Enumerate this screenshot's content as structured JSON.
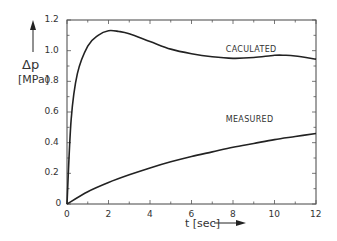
{
  "chart_data": {
    "type": "line",
    "title": "",
    "xlabel": "t [sec]",
    "ylabel_symbol": "Δp",
    "ylabel_unit": "[MPa]",
    "xlim": [
      0,
      12
    ],
    "ylim": [
      0,
      1.2
    ],
    "xticks": [
      "0",
      "2",
      "4",
      "6",
      "8",
      "10",
      "12"
    ],
    "yticks": [
      "0",
      "0.2",
      "0.4",
      "0.6",
      "0.8",
      "1.0",
      "1.2"
    ],
    "grid": false,
    "legend": "inline curve labels",
    "series": [
      {
        "name": "CACULATED",
        "x": [
          0,
          0.2,
          0.5,
          1.0,
          1.5,
          2.0,
          2.5,
          3.0,
          4.0,
          5.0,
          6.0,
          7.0,
          8.0,
          9.0,
          10.0,
          10.5,
          11.0,
          12.0
        ],
        "y": [
          0,
          0.55,
          0.85,
          1.03,
          1.1,
          1.13,
          1.125,
          1.11,
          1.06,
          1.01,
          0.98,
          0.96,
          0.95,
          0.955,
          0.97,
          0.97,
          0.965,
          0.945
        ]
      },
      {
        "name": "MEASURED",
        "x": [
          0,
          1,
          2,
          3,
          4,
          5,
          6,
          7,
          8,
          9,
          10,
          11,
          12
        ],
        "y": [
          0,
          0.08,
          0.14,
          0.19,
          0.235,
          0.275,
          0.31,
          0.34,
          0.37,
          0.395,
          0.42,
          0.44,
          0.46
        ]
      }
    ],
    "annotations": [
      {
        "text": "CACULATED",
        "x": 9.1,
        "y": 1.0
      },
      {
        "text": "MEASURED",
        "x": 9.1,
        "y": 0.54
      }
    ]
  }
}
